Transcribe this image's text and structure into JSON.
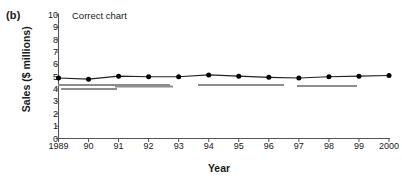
{
  "figure": {
    "panel_letter": "(b)",
    "annotation": "Correct chart"
  },
  "chart_data": {
    "type": "line",
    "title": "",
    "subtitle": "",
    "annotations": [
      "Correct chart"
    ],
    "xlabel": "Year",
    "ylabel": "Sales ($ millions)",
    "categories": [
      "1989",
      "90",
      "91",
      "92",
      "93",
      "94",
      "95",
      "96",
      "97",
      "98",
      "99",
      "2000"
    ],
    "x": [
      1989,
      1990,
      1991,
      1992,
      1993,
      1994,
      1995,
      1996,
      1997,
      1998,
      1999,
      2000
    ],
    "xtick_labels": [
      "1989",
      "90",
      "91",
      "92",
      "93",
      "94",
      "95",
      "96",
      "97",
      "98",
      "99",
      "2000"
    ],
    "ytick_labels": [
      "0",
      "1",
      "2",
      "3",
      "4",
      "5",
      "6",
      "7",
      "8",
      "9",
      "10"
    ],
    "values": [
      4.9,
      4.8,
      5.05,
      5.0,
      5.0,
      5.15,
      5.05,
      4.95,
      4.9,
      5.0,
      5.05,
      5.1
    ],
    "series": [
      {
        "name": "Sales",
        "values": [
          4.9,
          4.8,
          5.05,
          5.0,
          5.0,
          5.15,
          5.05,
          4.95,
          4.9,
          5.0,
          5.05,
          5.1
        ]
      }
    ],
    "ylim": [
      0,
      10
    ],
    "ytick_step": 1,
    "xlim": [
      1989,
      2000
    ],
    "grid": false,
    "legend": false,
    "legend_position": "none",
    "marker": "filled-circle",
    "line_color": "#222222",
    "marker_color": "#000000",
    "axis_color": "#555555",
    "background_color": "#ffffff"
  }
}
